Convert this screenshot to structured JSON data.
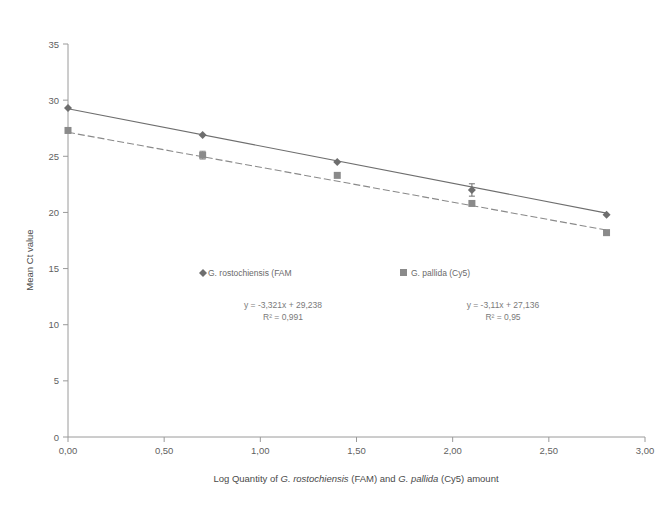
{
  "chart_data": {
    "type": "scatter",
    "title": "",
    "subtitle": "",
    "xlabel": "Log Quantity of G. rostochiensis (FAM) and G. pallida (Cy5) amount",
    "ylabel": "Mean Ct value",
    "xlim": [
      0,
      3
    ],
    "ylim": [
      0,
      35
    ],
    "grid": false,
    "legend_position": "inside-center",
    "x_ticks": [
      "0,00",
      "0,50",
      "1,00",
      "1,50",
      "2,00",
      "2,50",
      "3,00"
    ],
    "x_tick_values": [
      0,
      0.5,
      1,
      1.5,
      2,
      2.5,
      3
    ],
    "y_ticks": [
      "0",
      "5",
      "10",
      "15",
      "20",
      "25",
      "30",
      "35"
    ],
    "y_tick_values": [
      0,
      5,
      10,
      15,
      20,
      25,
      30,
      35
    ],
    "x": [
      0,
      0.7,
      1.4,
      2.1,
      2.8
    ],
    "series": [
      {
        "name": "G. rostochiensis (FAM",
        "marker": "diamond",
        "color": "#6e6e6e",
        "line_style": "solid",
        "values": [
          29.3,
          26.9,
          24.5,
          22.0,
          19.8
        ],
        "errors": [
          0.1,
          0.1,
          0.1,
          0.55,
          0.1
        ],
        "equation": "y = -3,321x + 29,238",
        "r_squared": "R² = 0,991",
        "slope": -3.321,
        "intercept": 29.238
      },
      {
        "name": "G. pallida (Cy5)",
        "marker": "square",
        "color": "#8a8a8a",
        "line_style": "dashed",
        "values": [
          27.3,
          25.1,
          23.3,
          20.8,
          18.2
        ],
        "errors": [
          0.15,
          0.35,
          0.1,
          0.1,
          0.1
        ],
        "equation": "y = -3,11x + 27,136",
        "r_squared": "R² = 0,95",
        "slope": -3.11,
        "intercept": 27.136
      }
    ]
  },
  "axis": {
    "y_title": "Mean Ct value",
    "x_title_parts": [
      {
        "text": "Log Quantity of ",
        "italic": false
      },
      {
        "text": "G. rostochiensis",
        "italic": true
      },
      {
        "text": " (FAM) and ",
        "italic": false
      },
      {
        "text": "G. pallida",
        "italic": true
      },
      {
        "text": " (Cy5) amount",
        "italic": false
      }
    ]
  },
  "legend": {
    "items": [
      {
        "label": "G. rostochiensis (FAM",
        "marker": "diamond",
        "color": "#6e6e6e"
      },
      {
        "label": "G. pallida (Cy5)",
        "marker": "square",
        "color": "#8a8a8a"
      }
    ]
  },
  "annotations": {
    "fam_equation": "y = -3,321x + 29,238",
    "fam_r2": "R² = 0,991",
    "cy5_equation": "y = -3,11x + 27,136",
    "cy5_r2": "R² = 0,95"
  },
  "colors": {
    "axis": "#9a9a9a",
    "fam_line": "#6e6e6e",
    "cy5_line": "#9b9b9b",
    "text": "#6b6b6b",
    "background": "#ffffff"
  }
}
